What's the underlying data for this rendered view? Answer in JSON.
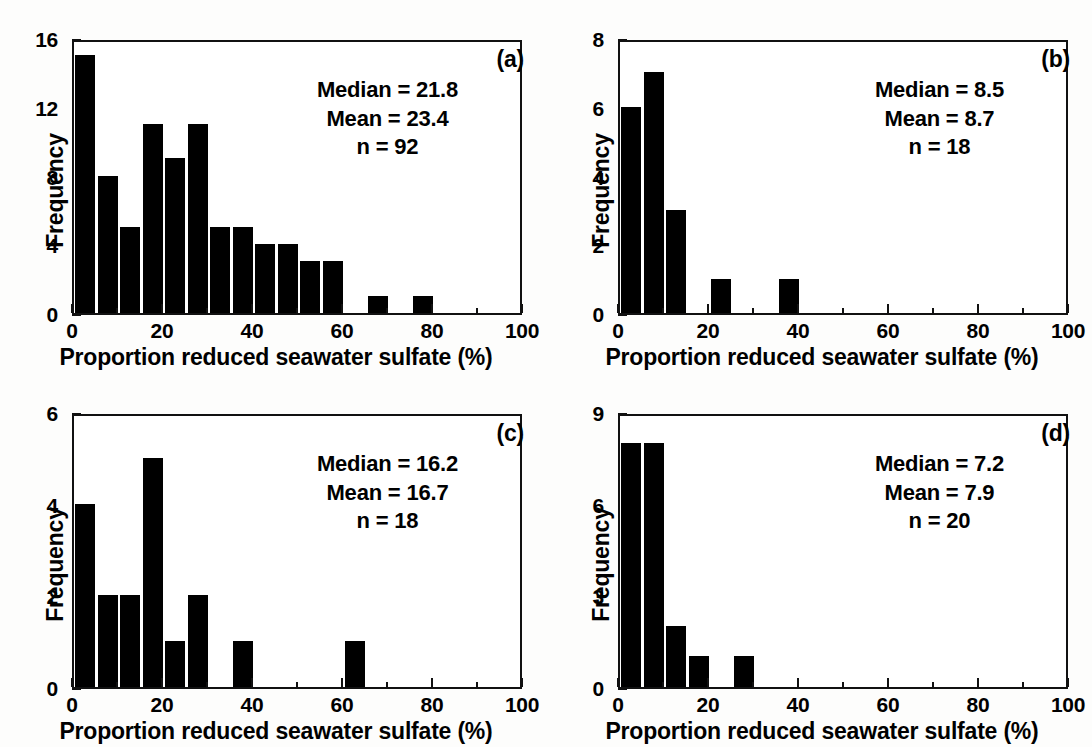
{
  "figure": {
    "background_color": "#fdfdfc",
    "bar_color": "#000000",
    "axis_color": "#111111",
    "panel_count": 4
  },
  "shared": {
    "xlabel": "Proportion reduced seawater sulfate (%)",
    "ylabel": "Frequency",
    "x_tick_labels": [
      "0",
      "20",
      "40",
      "60",
      "80",
      "100"
    ],
    "x_tick_values": [
      0,
      20,
      40,
      60,
      80,
      100
    ],
    "x_minor_tick_values": [
      10,
      30,
      50,
      70,
      90
    ],
    "xlim": [
      0,
      100
    ],
    "bin_width": 5
  },
  "panels": [
    {
      "id": "a",
      "letter": "(a)",
      "median_label": "Median = 21.8",
      "mean_label": "Mean = 23.4",
      "n_label": "n = 92",
      "y_tick_labels": [
        "0",
        "4",
        "8",
        "12",
        "16"
      ],
      "y_tick_values": [
        0,
        4,
        8,
        12,
        16
      ],
      "y_minor_tick_values": [
        2,
        6,
        10,
        14
      ],
      "ylim": [
        0,
        16
      ]
    },
    {
      "id": "b",
      "letter": "(b)",
      "median_label": "Median = 8.5",
      "mean_label": "Mean = 8.7",
      "n_label": "n = 18",
      "y_tick_labels": [
        "0",
        "2",
        "4",
        "6",
        "8"
      ],
      "y_tick_values": [
        0,
        2,
        4,
        6,
        8
      ],
      "y_minor_tick_values": [
        1,
        3,
        5,
        7
      ],
      "ylim": [
        0,
        8
      ]
    },
    {
      "id": "c",
      "letter": "(c)",
      "median_label": "Median = 16.2",
      "mean_label": "Mean = 16.7",
      "n_label": "n = 18",
      "y_tick_labels": [
        "0",
        "2",
        "4",
        "6"
      ],
      "y_tick_values": [
        0,
        2,
        4,
        6
      ],
      "y_minor_tick_values": [
        1,
        3,
        5
      ],
      "ylim": [
        0,
        6
      ]
    },
    {
      "id": "d",
      "letter": "(d)",
      "median_label": "Median = 7.2",
      "mean_label": "Mean = 7.9",
      "n_label": "n = 20",
      "y_tick_labels": [
        "0",
        "3",
        "6",
        "9"
      ],
      "y_tick_values": [
        0,
        3,
        6,
        9
      ],
      "y_minor_tick_values": [
        1.5,
        4.5,
        7.5
      ],
      "ylim": [
        0,
        9
      ]
    }
  ],
  "chart_data": [
    {
      "type": "bar",
      "panel": "a",
      "title": "(a)",
      "xlabel": "Proportion reduced seawater sulfate (%)",
      "ylabel": "Frequency",
      "xlim": [
        0,
        100
      ],
      "ylim": [
        0,
        16
      ],
      "grid": false,
      "legend": "none",
      "bin_width": 5,
      "bin_starts": [
        0,
        5,
        10,
        15,
        20,
        25,
        30,
        35,
        40,
        45,
        50,
        55,
        60,
        65,
        70,
        75,
        80,
        85,
        90,
        95
      ],
      "categories": [
        "0-5",
        "5-10",
        "10-15",
        "15-20",
        "20-25",
        "25-30",
        "30-35",
        "35-40",
        "40-45",
        "45-50",
        "50-55",
        "55-60",
        "60-65",
        "65-70",
        "70-75",
        "75-80",
        "80-85",
        "85-90",
        "90-95",
        "95-100"
      ],
      "values": [
        15,
        8,
        5,
        11,
        9,
        11,
        5,
        5,
        4,
        4,
        3,
        3,
        0,
        1,
        0,
        1,
        0,
        0,
        0,
        0
      ],
      "annotations": [
        "Median = 21.8",
        "Mean = 23.4",
        "n = 92"
      ],
      "statistics": {
        "median": 21.8,
        "mean": 23.4,
        "n": 92
      }
    },
    {
      "type": "bar",
      "panel": "b",
      "title": "(b)",
      "xlabel": "Proportion reduced seawater sulfate (%)",
      "ylabel": "Frequency",
      "xlim": [
        0,
        100
      ],
      "ylim": [
        0,
        8
      ],
      "grid": false,
      "legend": "none",
      "bin_width": 5,
      "bin_starts": [
        0,
        5,
        10,
        15,
        20,
        25,
        30,
        35,
        40,
        45,
        50,
        55,
        60,
        65,
        70,
        75,
        80,
        85,
        90,
        95
      ],
      "categories": [
        "0-5",
        "5-10",
        "10-15",
        "15-20",
        "20-25",
        "25-30",
        "30-35",
        "35-40",
        "40-45",
        "45-50",
        "50-55",
        "55-60",
        "60-65",
        "65-70",
        "70-75",
        "75-80",
        "80-85",
        "85-90",
        "90-95",
        "95-100"
      ],
      "values": [
        6,
        7,
        3,
        0,
        1,
        0,
        0,
        1,
        0,
        0,
        0,
        0,
        0,
        0,
        0,
        0,
        0,
        0,
        0,
        0
      ],
      "annotations": [
        "Median = 8.5",
        "Mean = 8.7",
        "n = 18"
      ],
      "statistics": {
        "median": 8.5,
        "mean": 8.7,
        "n": 18
      }
    },
    {
      "type": "bar",
      "panel": "c",
      "title": "(c)",
      "xlabel": "Proportion reduced seawater sulfate (%)",
      "ylabel": "Frequency",
      "xlim": [
        0,
        100
      ],
      "ylim": [
        0,
        6
      ],
      "grid": false,
      "legend": "none",
      "bin_width": 5,
      "bin_starts": [
        0,
        5,
        10,
        15,
        20,
        25,
        30,
        35,
        40,
        45,
        50,
        55,
        60,
        65,
        70,
        75,
        80,
        85,
        90,
        95
      ],
      "categories": [
        "0-5",
        "5-10",
        "10-15",
        "15-20",
        "20-25",
        "25-30",
        "30-35",
        "35-40",
        "40-45",
        "45-50",
        "50-55",
        "55-60",
        "60-65",
        "65-70",
        "70-75",
        "75-80",
        "80-85",
        "85-90",
        "90-95",
        "95-100"
      ],
      "values": [
        4,
        2,
        2,
        5,
        1,
        2,
        0,
        1,
        0,
        0,
        0,
        0,
        1,
        0,
        0,
        0,
        0,
        0,
        0,
        0
      ],
      "annotations": [
        "Median = 16.2",
        "Mean = 16.7",
        "n = 18"
      ],
      "statistics": {
        "median": 16.2,
        "mean": 16.7,
        "n": 18
      }
    },
    {
      "type": "bar",
      "panel": "d",
      "title": "(d)",
      "xlabel": "Proportion reduced seawater sulfate (%)",
      "ylabel": "Frequency",
      "xlim": [
        0,
        100
      ],
      "ylim": [
        0,
        9
      ],
      "grid": false,
      "legend": "none",
      "bin_width": 5,
      "bin_starts": [
        0,
        5,
        10,
        15,
        20,
        25,
        30,
        35,
        40,
        45,
        50,
        55,
        60,
        65,
        70,
        75,
        80,
        85,
        90,
        95
      ],
      "categories": [
        "0-5",
        "5-10",
        "10-15",
        "15-20",
        "20-25",
        "25-30",
        "30-35",
        "35-40",
        "40-45",
        "45-50",
        "50-55",
        "55-60",
        "60-65",
        "65-70",
        "70-75",
        "75-80",
        "80-85",
        "85-90",
        "90-95",
        "95-100"
      ],
      "values": [
        8,
        8,
        2,
        1,
        0,
        1,
        0,
        0,
        0,
        0,
        0,
        0,
        0,
        0,
        0,
        0,
        0,
        0,
        0,
        0
      ],
      "annotations": [
        "Median = 7.2",
        "Mean = 7.9",
        "n = 20"
      ],
      "statistics": {
        "median": 7.2,
        "mean": 7.9,
        "n": 20
      }
    }
  ]
}
